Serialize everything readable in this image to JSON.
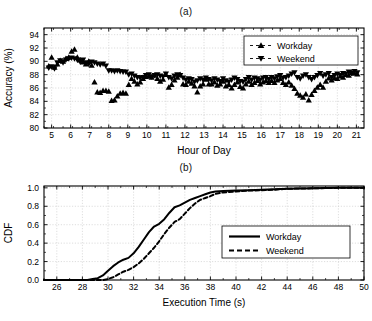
{
  "figure": {
    "panel_a_label": "(a)",
    "panel_b_label": "(b)"
  },
  "chart_data": [
    {
      "id": "accuracy-by-hour",
      "type": "scatter",
      "title": "(a)",
      "xlabel": "Hour of Day",
      "ylabel": "Accuracy (%)",
      "xlim": [
        4.6,
        21.4
      ],
      "ylim": [
        80,
        95
      ],
      "xticks": [
        5,
        6,
        7,
        8,
        9,
        10,
        11,
        12,
        13,
        14,
        15,
        16,
        17,
        18,
        19,
        20,
        21
      ],
      "yticks": [
        80,
        82,
        84,
        86,
        88,
        90,
        92,
        94
      ],
      "grid": true,
      "legend_position": "top-right",
      "legend": [
        "Workday",
        "Weekend"
      ],
      "series": [
        {
          "name": "Workday",
          "marker": "triangle-up",
          "linestyle": "dashed",
          "color": "#000000",
          "points": [
            [
              4.85,
              89.3
            ],
            [
              5.0,
              90.6
            ],
            [
              5.15,
              89.1
            ],
            [
              5.3,
              89.6
            ],
            [
              5.45,
              90.1
            ],
            [
              5.6,
              90.0
            ],
            [
              5.75,
              90.4
            ],
            [
              5.9,
              90.6
            ],
            [
              6.05,
              91.5
            ],
            [
              6.2,
              91.8
            ],
            [
              6.35,
              90.6
            ],
            [
              6.5,
              90.2
            ],
            [
              6.65,
              89.9
            ],
            [
              6.8,
              89.6
            ],
            [
              6.95,
              90.0
            ],
            [
              7.1,
              89.4
            ],
            [
              7.25,
              86.9
            ],
            [
              7.4,
              85.4
            ],
            [
              7.55,
              85.3
            ],
            [
              7.7,
              85.6
            ],
            [
              7.85,
              85.6
            ],
            [
              8.0,
              85.5
            ],
            [
              8.15,
              84.1
            ],
            [
              8.3,
              84.2
            ],
            [
              8.45,
              84.8
            ],
            [
              8.6,
              85.2
            ],
            [
              8.75,
              85.3
            ],
            [
              8.9,
              85.2
            ],
            [
              9.05,
              86.5
            ],
            [
              9.2,
              87.4
            ],
            [
              9.35,
              87.0
            ],
            [
              9.5,
              86.6
            ],
            [
              9.65,
              86.9
            ],
            [
              9.8,
              87.4
            ],
            [
              9.95,
              87.7
            ],
            [
              10.1,
              87.8
            ],
            [
              10.25,
              87.6
            ],
            [
              10.4,
              87.9
            ],
            [
              10.55,
              87.4
            ],
            [
              10.7,
              87.0
            ],
            [
              10.85,
              87.3
            ],
            [
              11.0,
              88.0
            ],
            [
              11.15,
              86.1
            ],
            [
              11.3,
              86.5
            ],
            [
              11.45,
              87.2
            ],
            [
              11.6,
              87.6
            ],
            [
              11.75,
              88.0
            ],
            [
              11.9,
              86.6
            ],
            [
              12.05,
              86.5
            ],
            [
              12.2,
              87.0
            ],
            [
              12.35,
              86.7
            ],
            [
              12.5,
              86.3
            ],
            [
              12.65,
              85.4
            ],
            [
              12.8,
              86.3
            ],
            [
              12.95,
              86.6
            ],
            [
              13.1,
              87.3
            ],
            [
              13.25,
              86.6
            ],
            [
              13.4,
              86.6
            ],
            [
              13.55,
              86.9
            ],
            [
              13.7,
              86.4
            ],
            [
              13.85,
              86.6
            ],
            [
              14.0,
              87.0
            ],
            [
              14.15,
              86.3
            ],
            [
              14.3,
              86.5
            ],
            [
              14.45,
              86.0
            ],
            [
              14.6,
              86.5
            ],
            [
              14.75,
              86.9
            ],
            [
              14.9,
              86.2
            ],
            [
              15.05,
              86.0
            ],
            [
              15.2,
              86.6
            ],
            [
              15.35,
              87.0
            ],
            [
              15.5,
              86.5
            ],
            [
              15.65,
              86.8
            ],
            [
              15.8,
              87.1
            ],
            [
              15.95,
              86.6
            ],
            [
              16.1,
              86.9
            ],
            [
              16.25,
              87.1
            ],
            [
              16.4,
              86.8
            ],
            [
              16.55,
              87.1
            ],
            [
              16.7,
              86.8
            ],
            [
              16.85,
              87.2
            ],
            [
              17.0,
              87.4
            ],
            [
              17.15,
              86.8
            ],
            [
              17.3,
              86.5
            ],
            [
              17.45,
              86.9
            ],
            [
              17.6,
              86.4
            ],
            [
              17.75,
              85.9
            ],
            [
              17.9,
              85.2
            ],
            [
              18.05,
              84.9
            ],
            [
              18.2,
              84.6
            ],
            [
              18.35,
              85.1
            ],
            [
              18.5,
              84.2
            ],
            [
              18.65,
              85.0
            ],
            [
              18.8,
              85.6
            ],
            [
              18.95,
              86.1
            ],
            [
              19.1,
              86.5
            ],
            [
              19.25,
              86.1
            ],
            [
              19.4,
              87.0
            ],
            [
              19.55,
              87.5
            ],
            [
              19.7,
              87.2
            ],
            [
              19.85,
              87.5
            ],
            [
              20.0,
              87.4
            ],
            [
              20.15,
              87.8
            ],
            [
              20.3,
              87.6
            ],
            [
              20.45,
              88.0
            ],
            [
              20.6,
              87.9
            ],
            [
              20.75,
              88.3
            ],
            [
              20.9,
              88.2
            ],
            [
              21.05,
              88.1
            ]
          ]
        },
        {
          "name": "Weekend",
          "marker": "triangle-down",
          "linestyle": "dashed",
          "color": "#000000",
          "points": [
            [
              4.85,
              89.0
            ],
            [
              5.0,
              89.2
            ],
            [
              5.15,
              88.9
            ],
            [
              5.3,
              89.8
            ],
            [
              5.45,
              90.1
            ],
            [
              5.6,
              89.8
            ],
            [
              5.75,
              90.2
            ],
            [
              5.9,
              90.4
            ],
            [
              6.05,
              90.5
            ],
            [
              6.2,
              90.4
            ],
            [
              6.35,
              90.2
            ],
            [
              6.5,
              89.9
            ],
            [
              6.65,
              90.2
            ],
            [
              6.8,
              89.8
            ],
            [
              6.95,
              89.6
            ],
            [
              7.1,
              89.9
            ],
            [
              7.25,
              89.8
            ],
            [
              7.4,
              89.6
            ],
            [
              7.55,
              89.5
            ],
            [
              7.7,
              89.6
            ],
            [
              7.85,
              89.3
            ],
            [
              8.0,
              88.6
            ],
            [
              8.15,
              88.6
            ],
            [
              8.3,
              88.5
            ],
            [
              8.45,
              88.6
            ],
            [
              8.6,
              88.5
            ],
            [
              8.75,
              88.4
            ],
            [
              8.9,
              88.4
            ],
            [
              9.05,
              88.0
            ],
            [
              9.2,
              88.1
            ],
            [
              9.35,
              87.8
            ],
            [
              9.5,
              87.6
            ],
            [
              9.65,
              87.5
            ],
            [
              9.8,
              87.6
            ],
            [
              9.95,
              87.9
            ],
            [
              10.1,
              88.0
            ],
            [
              10.25,
              87.7
            ],
            [
              10.4,
              87.9
            ],
            [
              10.55,
              88.0
            ],
            [
              10.7,
              87.8
            ],
            [
              10.85,
              87.7
            ],
            [
              11.0,
              88.1
            ],
            [
              11.15,
              87.6
            ],
            [
              11.3,
              87.4
            ],
            [
              11.45,
              87.8
            ],
            [
              11.6,
              88.0
            ],
            [
              11.75,
              87.9
            ],
            [
              11.9,
              87.5
            ],
            [
              12.05,
              87.2
            ],
            [
              12.2,
              87.4
            ],
            [
              12.35,
              87.3
            ],
            [
              12.5,
              86.9
            ],
            [
              12.65,
              87.1
            ],
            [
              12.8,
              87.4
            ],
            [
              12.95,
              87.2
            ],
            [
              13.1,
              87.5
            ],
            [
              13.25,
              87.3
            ],
            [
              13.4,
              87.1
            ],
            [
              13.55,
              87.4
            ],
            [
              13.7,
              87.2
            ],
            [
              13.85,
              87.0
            ],
            [
              14.0,
              87.4
            ],
            [
              14.15,
              87.1
            ],
            [
              14.3,
              86.9
            ],
            [
              14.45,
              87.2
            ],
            [
              14.6,
              87.5
            ],
            [
              14.75,
              87.3
            ],
            [
              14.9,
              87.0
            ],
            [
              15.05,
              86.9
            ],
            [
              15.2,
              87.3
            ],
            [
              15.35,
              87.6
            ],
            [
              15.5,
              87.2
            ],
            [
              15.65,
              87.5
            ],
            [
              15.8,
              87.4
            ],
            [
              15.95,
              87.2
            ],
            [
              16.1,
              87.5
            ],
            [
              16.25,
              87.6
            ],
            [
              16.4,
              87.3
            ],
            [
              16.55,
              87.6
            ],
            [
              16.7,
              87.4
            ],
            [
              16.85,
              87.7
            ],
            [
              17.0,
              87.9
            ],
            [
              17.15,
              87.5
            ],
            [
              17.3,
              87.6
            ],
            [
              17.45,
              87.8
            ],
            [
              17.6,
              88.1
            ],
            [
              17.75,
              88.3
            ],
            [
              17.9,
              87.6
            ],
            [
              18.05,
              87.4
            ],
            [
              18.2,
              87.8
            ],
            [
              18.35,
              88.0
            ],
            [
              18.5,
              87.6
            ],
            [
              18.65,
              87.3
            ],
            [
              18.8,
              87.6
            ],
            [
              18.95,
              87.9
            ],
            [
              19.1,
              88.2
            ],
            [
              19.25,
              87.8
            ],
            [
              19.4,
              88.0
            ],
            [
              19.55,
              88.2
            ],
            [
              19.7,
              87.6
            ],
            [
              19.85,
              87.9
            ],
            [
              20.0,
              88.1
            ],
            [
              20.15,
              87.9
            ],
            [
              20.3,
              88.2
            ],
            [
              20.45,
              88.1
            ],
            [
              20.6,
              88.4
            ],
            [
              20.75,
              88.2
            ],
            [
              20.9,
              88.5
            ],
            [
              21.05,
              88.3
            ]
          ]
        }
      ]
    },
    {
      "id": "execution-time-cdf",
      "type": "line",
      "title": "(b)",
      "xlabel": "Execution Time (s)",
      "ylabel": "CDF",
      "xlim": [
        25,
        50
      ],
      "ylim": [
        0.0,
        1.02
      ],
      "xticks": [
        26,
        28,
        30,
        32,
        34,
        36,
        38,
        40,
        42,
        44,
        46,
        48,
        50
      ],
      "yticks": [
        0.0,
        0.2,
        0.4,
        0.6,
        0.8,
        1.0
      ],
      "ytick_labels": [
        "0.0",
        "0.2",
        "0.4",
        "0.6",
        "0.8",
        "1.0"
      ],
      "grid": true,
      "legend_position": "right-middle",
      "legend": [
        "Workday",
        "Weekend"
      ],
      "series": [
        {
          "name": "Workday",
          "linestyle": "solid",
          "color": "#000000",
          "x": [
            25,
            28.4,
            28.8,
            29.2,
            29.6,
            30.0,
            30.4,
            30.8,
            31.2,
            31.6,
            32.0,
            32.4,
            32.8,
            33.2,
            33.6,
            34.0,
            34.4,
            34.8,
            35.2,
            35.6,
            36.0,
            36.4,
            36.8,
            37.2,
            37.6,
            38.0,
            38.4,
            39.0,
            40.0,
            41.0,
            42.0,
            43.0,
            44.0,
            46.0,
            48.0,
            50.0
          ],
          "y": [
            0.0,
            0.0,
            0.01,
            0.02,
            0.05,
            0.1,
            0.15,
            0.19,
            0.22,
            0.24,
            0.29,
            0.36,
            0.44,
            0.52,
            0.58,
            0.61,
            0.66,
            0.73,
            0.79,
            0.81,
            0.84,
            0.87,
            0.89,
            0.91,
            0.93,
            0.95,
            0.96,
            0.965,
            0.97,
            0.975,
            0.98,
            0.985,
            0.99,
            0.995,
            1.0,
            1.0
          ]
        },
        {
          "name": "Weekend",
          "linestyle": "dashed",
          "color": "#000000",
          "x": [
            25,
            29.6,
            30.0,
            30.4,
            30.8,
            31.2,
            31.6,
            32.0,
            32.4,
            32.8,
            33.2,
            33.6,
            34.0,
            34.4,
            34.8,
            35.2,
            35.6,
            36.0,
            36.4,
            36.8,
            37.2,
            37.6,
            38.0,
            38.4,
            39.0,
            40.0,
            41.0,
            42.0,
            43.0,
            44.0,
            46.0,
            48.0,
            50.0
          ],
          "y": [
            0.0,
            0.0,
            0.01,
            0.03,
            0.06,
            0.09,
            0.11,
            0.14,
            0.18,
            0.23,
            0.29,
            0.35,
            0.42,
            0.5,
            0.57,
            0.63,
            0.66,
            0.72,
            0.78,
            0.83,
            0.87,
            0.89,
            0.91,
            0.935,
            0.95,
            0.96,
            0.97,
            0.975,
            0.98,
            0.99,
            0.995,
            1.0,
            1.0
          ]
        }
      ]
    }
  ]
}
